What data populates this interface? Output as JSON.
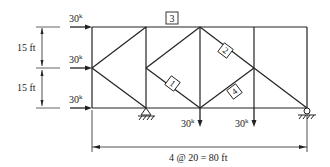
{
  "diagram": {
    "type": "truss",
    "loads": {
      "top_left": "30",
      "mid_left": "30",
      "bottom_left": "30",
      "bottom_node_2": "30",
      "bottom_node_3": "30",
      "unit_superscript": "k"
    },
    "dimensions": {
      "upper_height": "15 ft",
      "lower_height": "15 ft",
      "span": "4 @ 20 = 80 ft"
    },
    "member_labels": {
      "m1": "1",
      "m2": "2",
      "m3": "3",
      "m4": "4"
    },
    "supports": {
      "left": "pin",
      "right": "roller"
    },
    "colors": {
      "line": "#222222",
      "background": "#ffffff"
    }
  }
}
